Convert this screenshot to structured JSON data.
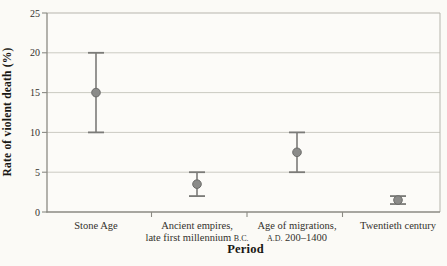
{
  "chart_data": {
    "type": "scatter",
    "subtype": "points-with-error-bars",
    "title": "",
    "xlabel": "Period",
    "ylabel": "Rate of violent death (%)",
    "ylim": [
      0,
      25
    ],
    "yticks": [
      0,
      5,
      10,
      15,
      20,
      25
    ],
    "grid": true,
    "legend": false,
    "categories": [
      "Stone Age",
      "Ancient empires, late first millennium B.C.",
      "Age of migrations, A.D. 200–1400",
      "Twentieth century"
    ],
    "category_label_lines": [
      [
        "Stone Age"
      ],
      [
        "Ancient empires,",
        "late first millennium B.C."
      ],
      [
        "Age of migrations,",
        "A.D. 200–1400"
      ],
      [
        "Twentieth century"
      ]
    ],
    "series": [
      {
        "name": "Rate of violent death",
        "values": [
          15,
          3.5,
          7.5,
          1.5
        ],
        "error_low": [
          10,
          2,
          5,
          1
        ],
        "error_high": [
          20,
          5,
          10,
          2
        ]
      }
    ],
    "colors": {
      "background": "#fbfaf6",
      "plot_background": "#fcfbf8",
      "grid": "#cbcac2",
      "border": "#b6b5ad",
      "axis": "#8b8a83",
      "error_bar": "#7b7b78",
      "marker_fill": "#8b8b89",
      "marker_edge": "#6c6c6a",
      "label_text": "#33312c",
      "title_text": "#181713"
    }
  }
}
